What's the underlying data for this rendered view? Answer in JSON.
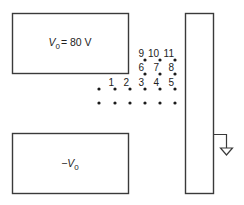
{
  "diagram": {
    "type": "electrostatics-plates",
    "top_plate": {
      "label_var": "V",
      "label_sub": "0",
      "label_rest": "= 80 V",
      "potential": "V0 = 80 V"
    },
    "bottom_plate": {
      "label_prefix": "−",
      "label_var": "V",
      "label_sub": "0",
      "potential": "-V0"
    },
    "right_plate": {
      "connection": "ground",
      "icon": "ground-icon"
    },
    "points": [
      {
        "id": "1",
        "x": 115,
        "y": 89
      },
      {
        "id": "2",
        "x": 130,
        "y": 89
      },
      {
        "id": "3",
        "x": 145,
        "y": 89
      },
      {
        "id": "4",
        "x": 160,
        "y": 89
      },
      {
        "id": "5",
        "x": 175,
        "y": 89
      },
      {
        "id": "6",
        "x": 145,
        "y": 74
      },
      {
        "id": "7",
        "x": 160,
        "y": 74
      },
      {
        "id": "8",
        "x": 175,
        "y": 74
      },
      {
        "id": "9",
        "x": 145,
        "y": 60
      },
      {
        "id": "10",
        "x": 160,
        "y": 60
      },
      {
        "id": "11",
        "x": 175,
        "y": 60
      }
    ],
    "unlabeled_dots": [
      {
        "x": 99,
        "y": 89
      },
      {
        "x": 99,
        "y": 103
      },
      {
        "x": 115,
        "y": 103
      },
      {
        "x": 130,
        "y": 103
      },
      {
        "x": 145,
        "y": 103
      },
      {
        "x": 160,
        "y": 103
      },
      {
        "x": 175,
        "y": 103
      }
    ]
  }
}
